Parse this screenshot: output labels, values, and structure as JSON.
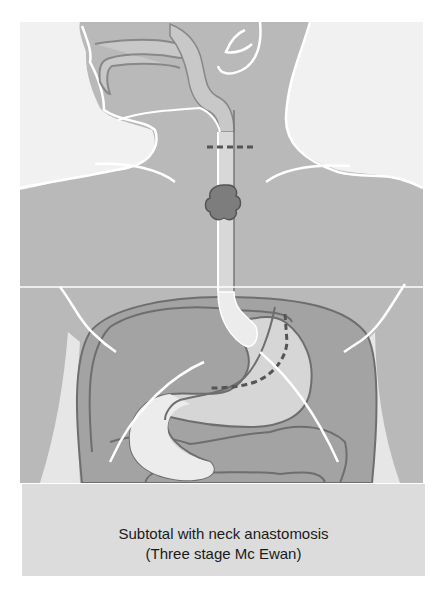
{
  "figure": {
    "title": "Subtotal with neck anastomosis",
    "subtitle": "(Three stage Mc Ewan)",
    "colors": {
      "background_light": "#f1f1f1",
      "skin_body": "#b9b9b9",
      "pharynx_fill": "#c8c8c8",
      "abdomen_cavity": "#a3a3a3",
      "organ_outline": "#6e6e6e",
      "esophagus_stomach_fill": "#e8e8e8",
      "stomach_fill": "#d6d6d6",
      "tumor_fill": "#7d7d7d",
      "outline_white": "#ffffff",
      "dashed_resection": "#555555",
      "caption_bg": "#dcdcdc"
    },
    "labels": []
  },
  "caption": {
    "line1": "Subtotal with neck anastomosis",
    "line2": "(Three stage Mc Ewan)"
  }
}
